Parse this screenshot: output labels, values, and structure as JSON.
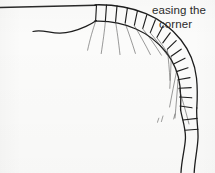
{
  "drawing": {
    "title": "easing the corner",
    "medium": "hand-drawn pen sketch on off-white paper",
    "background_color": "#fbfbfa",
    "ink_color": "#1e1e1e",
    "ray_ink_color": "#3a3a3a",
    "annotation": {
      "line_1": "easing the",
      "line_2": "corner",
      "color": "#2b2b2b"
    },
    "strokes": {
      "top_edge_line": "M 0 7.5 L 96 5.2",
      "ground_wave_line": "M 33 31.5 C 42 29.0, 50 33.4, 60 33.2 C 70 33.0, 78 30.0, 86 26.4 C 91 24.2, 94 22.3, 96.5 20.6",
      "band_outer_edge": "M 95 4.8 C 112 4.4, 130 7.0, 146 13.6 C 160 19.4, 172 28.6, 181 40.0 C 190 51.4, 195 64.4, 196.5 78.0 C 197.6 88.6, 197.4 98.6, 196.8 108.0",
      "band_inner_edge": "M 94.5 21.2 C 109 20.6, 123 23.2, 136 29.0 C 148 34.2, 158 42.2, 166 52.2 C 174 62.4, 178.6 74.0, 180.0 86.2 C 181.0 95.2, 181.0 102.6, 180.6 110.0",
      "band_joints": [
        "M 96.5 4.9 L 95.6 21.0",
        "M 106.5 5.0 L 105.4 20.8",
        "M 117.0 5.9 L 115.6 21.4",
        "M 127.4 8.0 L 125.2 22.8",
        "M 137.4 11.0 L 134.4 25.2",
        "M 146.8 14.8 L 142.8 28.4",
        "M 155.4 19.8 L 150.4 32.4",
        "M 163.2 25.8 L 157.0 37.2",
        "M 170.2 32.8 L 162.8 42.8",
        "M 176.2 40.6 L 167.4 49.2",
        "M 181.2 49.2 L 171.2 56.2",
        "M 185.0 58.2 L 174.2 63.8",
        "M 188.0 67.8 L 176.4 71.6",
        "M 190.0 77.6 L 178.0 79.8",
        "M 191.2 87.6 L 179.0 88.2",
        "M 191.8 97.8 L 179.6 97.0",
        "M 192.0 107.8 L 180.0 106.0"
      ],
      "rays": [
        "M 95.6 21.6 C 93.0 29.0, 90.0 39.0, 87.6 50.2",
        "M 105.4 21.4 C 104.6 30.0, 103.0 41.6, 101.2 53.6",
        "M 115.6 22.0 C 117.0 30.4, 118.6 42.2, 120.0 54.6",
        "M 125.2 23.4 C 128.2 31.4, 132.0 42.4, 135.4 53.4",
        "M 134.4 25.8 C 139.0 33.4, 145.2 44.2, 150.4 54.6",
        "M 142.8 29.0 C 148.6 36.0, 155.6 45.8, 161.4 55.2",
        "M 150.4 33.0 C 155.4 39.0, 161.6 47.0, 166.8 54.6",
        "M 157.0 37.8 C 161.2 43.4, 166.0 50.4, 170.2 57.0",
        "M 167.4 49.8 C 168.4 58.4, 169.4 70.0, 170.0 80.4",
        "M 171.2 56.8 C 171.0 66.0, 170.4 78.0, 169.8 88.4",
        "M 176.4 72.2 C 174.4 82.0, 171.8 95.0, 169.6 107.0",
        "M 178.0 80.4 C 177.2 92.0, 176.0 106.0, 175.0 118.0",
        "M 179.0 88.8 C 182.2 99.0, 186.0 112.0, 189.0 124.0"
      ],
      "tail_wave_outer": "M 196.8 108.0 C 196.0 118.0, 198.4 128.0, 198.0 138.0 C 197.6 149.0, 194.8 160.0, 194.2 172.5",
      "tail_wave_inner": "M 180.6 110.0 C 182.4 120.0, 186.0 129.0, 185.4 139.0 C 184.8 149.5, 181.6 160.0, 181.0 172.5",
      "tail_joints": [
        "M 197.2 118.4 L 183.0 120.0",
        "M 198.0 129.2 L 185.0 130.2"
      ],
      "tick_marks": [
        "M 163.0 116.0 L 161.4 121.6",
        "M 158.8 118.2 L 157.4 122.4",
        "M 175.0 114.0 L 173.6 119.0"
      ]
    }
  }
}
